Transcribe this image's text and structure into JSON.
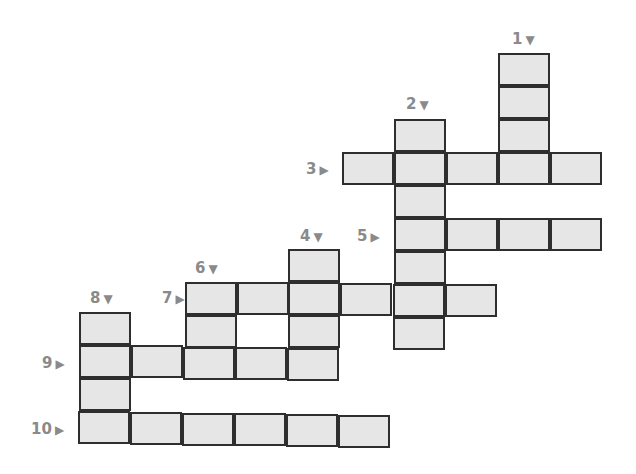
{
  "puzzle": {
    "type": "crossword",
    "cell_fill": "#e6e6e6",
    "border_color": "#2e2e2e",
    "label_color": "#8a8a8a",
    "clues": [
      {
        "number": "1",
        "direction": "down",
        "arrow": "▼",
        "length": 4
      },
      {
        "number": "2",
        "direction": "down",
        "arrow": "▼",
        "length": 7
      },
      {
        "number": "3",
        "direction": "across",
        "arrow": "▶",
        "length": 5
      },
      {
        "number": "4",
        "direction": "down",
        "arrow": "▼",
        "length": 4
      },
      {
        "number": "5",
        "direction": "across",
        "arrow": "▶",
        "length": 4
      },
      {
        "number": "6",
        "direction": "down",
        "arrow": "▼",
        "length": 3
      },
      {
        "number": "7",
        "direction": "across",
        "arrow": "▶",
        "length": 6
      },
      {
        "number": "8",
        "direction": "down",
        "arrow": "▼",
        "length": 4
      },
      {
        "number": "9",
        "direction": "across",
        "arrow": "▶",
        "length": 5
      },
      {
        "number": "10",
        "direction": "across",
        "arrow": "▶",
        "length": 6
      }
    ]
  }
}
